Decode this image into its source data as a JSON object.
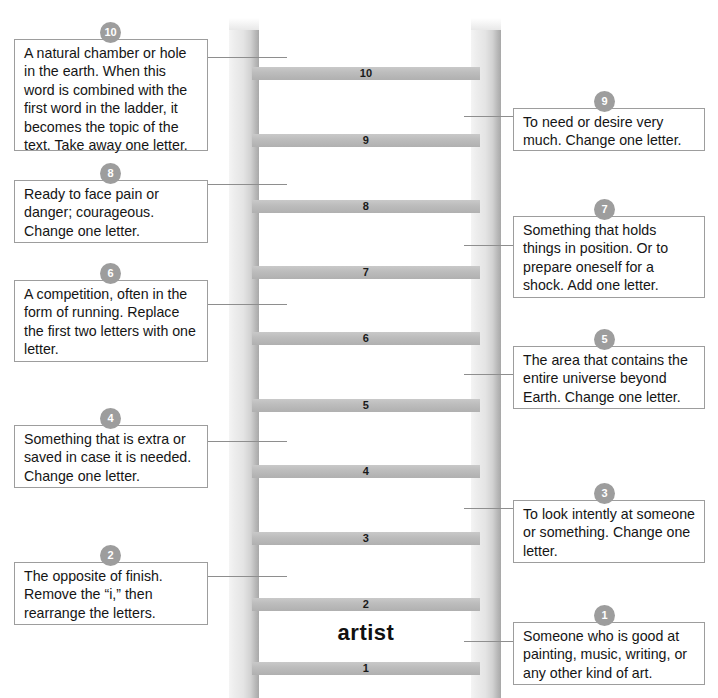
{
  "ladder": {
    "start_word": "artist",
    "rungs": [
      "1",
      "2",
      "3",
      "4",
      "5",
      "6",
      "7",
      "8",
      "9",
      "10"
    ],
    "rail_color": "#bdbdbd",
    "rung_color": "#bdbdbd"
  },
  "badge_color": "#9d9d9d",
  "clues_left": [
    {
      "number": "10",
      "text": "A natural chamber or hole in the earth.  When this word is combined with the first word in the ladder, it becomes the topic of the text.  Take away one letter."
    },
    {
      "number": "8",
      "text": "Ready to face pain or danger; courageous. Change one letter."
    },
    {
      "number": "6",
      "text": "A competition, often in the form of running. Replace the first two letters with one letter."
    },
    {
      "number": "4",
      "text": "Something that is extra or saved in case it is needed. Change one letter."
    },
    {
      "number": "2",
      "text": "The opposite of finish. Remove the “i,” then rearrange the letters."
    }
  ],
  "clues_right": [
    {
      "number": "9",
      "text": "To need or desire very much.  Change one letter."
    },
    {
      "number": "7",
      "text": "Something that holds things in position.  Or to prepare oneself for a shock.  Add one letter."
    },
    {
      "number": "5",
      "text": "The area that contains the entire universe beyond Earth.  Change one letter."
    },
    {
      "number": "3",
      "text": "To look intently at someone or something. Change one letter."
    },
    {
      "number": "1",
      "text": "Someone who is good at painting, music, writing, or any other kind of art."
    }
  ]
}
